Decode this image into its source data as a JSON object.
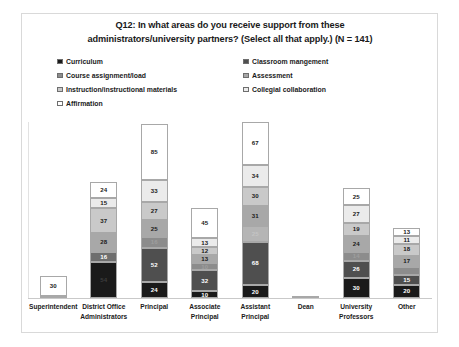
{
  "chart": {
    "title": "Q12: In what areas do you receive support from these administrators/university partners? (Select all that apply.) (N = 141)",
    "title_line1": "Q12: In what areas do you receive support from these",
    "title_line2": "administrators/university partners? (Select all that apply.) (N = 141)"
  },
  "legend": {
    "items": [
      {
        "label": "Curriculum",
        "color": "#1a1a1a",
        "column": "a",
        "row": 0
      },
      {
        "label": "Classroom mangement",
        "color": "#4f4f4f",
        "column": "b",
        "row": 0
      },
      {
        "label": "Course assignment/load",
        "color": "#8c8c8c",
        "column": "a",
        "row": 1
      },
      {
        "label": "Assessment",
        "color": "#a8a8a8",
        "column": "b",
        "row": 1
      },
      {
        "label": "Instruction/instructional materials",
        "color": "#c9c9c9",
        "column": "a",
        "row": 2
      },
      {
        "label": "Collegial collaboration",
        "color": "#ebebeb",
        "column": "b",
        "row": 2
      },
      {
        "label": "Affirmation",
        "color": "#ffffff",
        "column": "a",
        "row": 3
      }
    ]
  },
  "chart_data": {
    "type": "bar",
    "subtype": "stacked-bar",
    "title": "Q12: In what areas do you receive support from these administrators/university partners? (Select all that apply.) (N = 141)",
    "xlabel": "",
    "ylabel": "",
    "grid": false,
    "legend_position": "top",
    "n": 141,
    "ylim": [
      0,
      265
    ],
    "categories": [
      "Superintendent",
      "District Office Administrators",
      "Principal",
      "Associate Principal",
      "Assistant Principal",
      "Dean",
      "University Professors",
      "Other"
    ],
    "category_lines": [
      [
        "Superintendent"
      ],
      [
        "District Office",
        "Administrators"
      ],
      [
        "Principal"
      ],
      [
        "Associate",
        "Principal"
      ],
      [
        "Assistant",
        "Principal"
      ],
      [
        "Dean"
      ],
      [
        "University",
        "Professors"
      ],
      [
        "Other"
      ]
    ],
    "series": [
      {
        "name": "Curriculum",
        "color": "#1a1a1a",
        "values": [
          3,
          54,
          24,
          10,
          20,
          3,
          30,
          20
        ]
      },
      {
        "name": "Classroom mangement",
        "color": "#4f4f4f",
        "values": [
          0,
          16,
          52,
          32,
          68,
          0,
          26,
          15
        ]
      },
      {
        "name": "Course assignment/load",
        "color": "#8c8c8c",
        "values": [
          0,
          28,
          16,
          10,
          25,
          0,
          14,
          12
        ]
      },
      {
        "name": "Assessment",
        "color": "#a8a8a8",
        "values": [
          0,
          37,
          25,
          13,
          31,
          0,
          24,
          17
        ]
      },
      {
        "name": "Instruction/instructional materials",
        "color": "#c9c9c9",
        "values": [
          0,
          15,
          27,
          12,
          30,
          0,
          19,
          18
        ]
      },
      {
        "name": "Collegial collaboration",
        "color": "#ebebeb",
        "values": [
          0,
          24,
          33,
          13,
          34,
          0,
          27,
          11
        ]
      },
      {
        "name": "Affirmation",
        "color": "#ffffff",
        "values": [
          30,
          0,
          85,
          45,
          67,
          0,
          25,
          13
        ]
      }
    ],
    "bars": [
      {
        "category": "Superintendent",
        "segments": [
          {
            "series": "Affirmation",
            "value": 30,
            "label": "30",
            "color": "#ffffff",
            "label_color": "#1a1a1a",
            "show_label": true
          },
          {
            "series": "Curriculum",
            "value": 3,
            "label": "",
            "color": "#1a1a1a",
            "label_color": "#ffffff",
            "show_label": false
          }
        ],
        "total": 33
      },
      {
        "category": "District Office Administrators",
        "segments": [
          {
            "series": "Collegial collaboration",
            "value": 24,
            "label": "24",
            "color": "#ffffff",
            "label_color": "#1a1a1a",
            "show_label": true
          },
          {
            "series": "Instruction/instructional materials",
            "value": 15,
            "label": "15",
            "color": "#ebebeb",
            "label_color": "#1a1a1a",
            "show_label": true
          },
          {
            "series": "Assessment",
            "value": 37,
            "label": "37",
            "color": "#c9c9c9",
            "label_color": "#1a1a1a",
            "show_label": true
          },
          {
            "series": "Course assignment/load",
            "value": 28,
            "label": "28",
            "color": "#a8a8a8",
            "label_color": "#1a1a1a",
            "show_label": true
          },
          {
            "series": "Classroom mangement",
            "value": 16,
            "label": "16",
            "color": "#6e6e6e",
            "label_color": "#ffffff",
            "show_label": true
          },
          {
            "series": "Curriculum",
            "value": 54,
            "label": "54",
            "color": "#1a1a1a",
            "label_color": "#3d3d3d",
            "show_label": true
          }
        ],
        "total": 174
      },
      {
        "category": "Principal",
        "segments": [
          {
            "series": "Affirmation",
            "value": 85,
            "label": "85",
            "color": "#ffffff",
            "label_color": "#1a1a1a",
            "show_label": true
          },
          {
            "series": "Collegial collaboration",
            "value": 33,
            "label": "33",
            "color": "#ebebeb",
            "label_color": "#1a1a1a",
            "show_label": true
          },
          {
            "series": "Instruction/instructional materials",
            "value": 27,
            "label": "27",
            "color": "#c9c9c9",
            "label_color": "#1a1a1a",
            "show_label": true
          },
          {
            "series": "Assessment",
            "value": 25,
            "label": "25",
            "color": "#a8a8a8",
            "label_color": "#1a1a1a",
            "show_label": true
          },
          {
            "series": "Course assignment/load",
            "value": 16,
            "label": "16",
            "color": "#8c8c8c",
            "label_color": "#9e9e9e",
            "show_label": true
          },
          {
            "series": "Classroom mangement",
            "value": 52,
            "label": "52",
            "color": "#4f4f4f",
            "label_color": "#ffffff",
            "show_label": true
          },
          {
            "series": "Curriculum",
            "value": 24,
            "label": "24",
            "color": "#1a1a1a",
            "label_color": "#ffffff",
            "show_label": true
          }
        ],
        "total": 262
      },
      {
        "category": "Associate Principal",
        "segments": [
          {
            "series": "Affirmation",
            "value": 45,
            "label": "45",
            "color": "#ffffff",
            "label_color": "#1a1a1a",
            "show_label": true
          },
          {
            "series": "Collegial collaboration",
            "value": 13,
            "label": "13",
            "color": "#ebebeb",
            "label_color": "#1a1a1a",
            "show_label": true
          },
          {
            "series": "Instruction/instructional materials",
            "value": 12,
            "label": "12",
            "color": "#c9c9c9",
            "label_color": "#1a1a1a",
            "show_label": true
          },
          {
            "series": "Assessment",
            "value": 13,
            "label": "13",
            "color": "#a8a8a8",
            "label_color": "#1a1a1a",
            "show_label": true
          },
          {
            "series": "Course assignment/load",
            "value": 10,
            "label": "10",
            "color": "#8c8c8c",
            "label_color": "#9e9e9e",
            "show_label": true
          },
          {
            "series": "Classroom mangement",
            "value": 32,
            "label": "32",
            "color": "#4f4f4f",
            "label_color": "#ffffff",
            "show_label": true
          },
          {
            "series": "Curriculum",
            "value": 10,
            "label": "10",
            "color": "#1a1a1a",
            "label_color": "#ffffff",
            "show_label": true
          }
        ],
        "total": 135
      },
      {
        "category": "Assistant Principal",
        "segments": [
          {
            "series": "Affirmation",
            "value": 67,
            "label": "67",
            "color": "#ffffff",
            "label_color": "#1a1a1a",
            "show_label": true
          },
          {
            "series": "Collegial collaboration",
            "value": 34,
            "label": "34",
            "color": "#ebebeb",
            "label_color": "#1a1a1a",
            "show_label": true
          },
          {
            "series": "Instruction/instructional materials",
            "value": 30,
            "label": "30",
            "color": "#c9c9c9",
            "label_color": "#1a1a1a",
            "show_label": true
          },
          {
            "series": "Assessment",
            "value": 31,
            "label": "31",
            "color": "#a8a8a8",
            "label_color": "#1a1a1a",
            "show_label": true
          },
          {
            "series": "Course assignment/load",
            "value": 25,
            "label": "25",
            "color": "#b5b5b5",
            "label_color": "#c4c4c4",
            "show_label": true
          },
          {
            "series": "Classroom mangement",
            "value": 68,
            "label": "68",
            "color": "#4f4f4f",
            "label_color": "#ffffff",
            "show_label": true
          },
          {
            "series": "Curriculum",
            "value": 20,
            "label": "20",
            "color": "#1a1a1a",
            "label_color": "#ffffff",
            "show_label": true
          }
        ],
        "total": 275
      },
      {
        "category": "Dean",
        "segments": [
          {
            "series": "Curriculum",
            "value": 3,
            "label": "",
            "color": "#3d3d3d",
            "label_color": "#ffffff",
            "show_label": false
          }
        ],
        "total": 3
      },
      {
        "category": "University Professors",
        "segments": [
          {
            "series": "Affirmation",
            "value": 25,
            "label": "25",
            "color": "#ffffff",
            "label_color": "#1a1a1a",
            "show_label": true
          },
          {
            "series": "Collegial collaboration",
            "value": 27,
            "label": "27",
            "color": "#ebebeb",
            "label_color": "#1a1a1a",
            "show_label": true
          },
          {
            "series": "Instruction/instructional materials",
            "value": 19,
            "label": "19",
            "color": "#c9c9c9",
            "label_color": "#1a1a1a",
            "show_label": true
          },
          {
            "series": "Assessment",
            "value": 24,
            "label": "24",
            "color": "#a8a8a8",
            "label_color": "#1a1a1a",
            "show_label": true
          },
          {
            "series": "Course assignment/load",
            "value": 14,
            "label": "14",
            "color": "#8c8c8c",
            "label_color": "#9e9e9e",
            "show_label": true
          },
          {
            "series": "Classroom mangement",
            "value": 26,
            "label": "26",
            "color": "#4f4f4f",
            "label_color": "#ffffff",
            "show_label": true
          },
          {
            "series": "Curriculum",
            "value": 30,
            "label": "30",
            "color": "#1a1a1a",
            "label_color": "#ffffff",
            "show_label": true
          }
        ],
        "total": 165
      },
      {
        "category": "Other",
        "segments": [
          {
            "series": "Affirmation",
            "value": 13,
            "label": "13",
            "color": "#ffffff",
            "label_color": "#1a1a1a",
            "show_label": true
          },
          {
            "series": "Collegial collaboration",
            "value": 11,
            "label": "11",
            "color": "#ebebeb",
            "label_color": "#1a1a1a",
            "show_label": true
          },
          {
            "series": "Instruction/instructional materials",
            "value": 18,
            "label": "18",
            "color": "#c9c9c9",
            "label_color": "#1a1a1a",
            "show_label": true
          },
          {
            "series": "Assessment",
            "value": 17,
            "label": "17",
            "color": "#a8a8a8",
            "label_color": "#1a1a1a",
            "show_label": true
          },
          {
            "series": "Course assignment/load",
            "value": 12,
            "label": "",
            "color": "#8c8c8c",
            "label_color": "#9e9e9e",
            "show_label": false
          },
          {
            "series": "Classroom mangement",
            "value": 15,
            "label": "15",
            "color": "#4f4f4f",
            "label_color": "#ffffff",
            "show_label": true
          },
          {
            "series": "Curriculum",
            "value": 20,
            "label": "20",
            "color": "#1a1a1a",
            "label_color": "#ffffff",
            "show_label": true
          }
        ],
        "total": 106
      }
    ]
  }
}
